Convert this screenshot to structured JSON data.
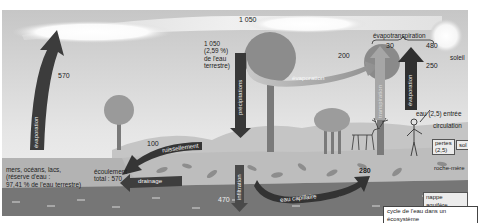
{
  "diagram": {
    "title": "cycle de l'eau dans un écosystème",
    "colors": {
      "sky_top": "#c9c9c9",
      "sky_bottom": "#f0f0f0",
      "arrow_dark": "#3a3a3a",
      "arrow_light": "#8a8a8a",
      "soil": "#b4b4b4",
      "rock": "#9e9e9e",
      "aquifer": "#6e6e6e",
      "sea": "#a8a8a8"
    },
    "top_flow": {
      "value": "1 050"
    },
    "left": {
      "evaporation_value": "570",
      "evaporation_label": "évaporation",
      "reservoir_line1": "mers, océans, lacs,",
      "reservoir_line2": "(réserve d'eau :",
      "reservoir_line3": "97,41 % de l'eau terrestre)"
    },
    "precipitation": {
      "label": "précipitations",
      "value_line1": "1 050",
      "value_line2": "(2,59 %)",
      "value_line3": "de l'eau",
      "value_line4": "terrestre)"
    },
    "evaporation_mid": {
      "label": "évaporation",
      "value": "200"
    },
    "evapotranspiration": {
      "label": "évapotranspiration",
      "transpiration_value": "30",
      "transpiration_label": "transpiration",
      "evaporation_value": "480",
      "evaporation_sub_value": "250",
      "evaporation_label": "évaporation"
    },
    "sun": {
      "label": "soleil"
    },
    "runoff": {
      "value": "100",
      "label": "ruissellement",
      "total_line1": "écoulement",
      "total_line2": "total : 570",
      "drainage_label": "drainage"
    },
    "infiltration": {
      "label": "infiltration",
      "value": "470"
    },
    "capillary": {
      "label": "eau capillaire",
      "value": "280"
    },
    "organism": {
      "input_label": "eau (2,5) entrée",
      "circulation_label": "circulation",
      "loss_line1": "pertes",
      "loss_line2": "(2,5)"
    },
    "layers": {
      "soil": "sol",
      "bedrock": "roche-mère",
      "aquifer": "nappe aquifère"
    }
  }
}
